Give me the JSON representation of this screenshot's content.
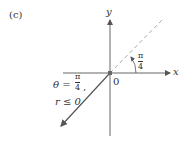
{
  "figure": {
    "panel_label": "(c)",
    "axes": {
      "x_label": "x",
      "y_label": "y",
      "origin_label": "0"
    },
    "angle_label": {
      "numerator": "π",
      "denominator": "4"
    },
    "equation": {
      "theta_prefix": "θ =",
      "theta_numerator": "π",
      "theta_denominator": "4",
      "theta_suffix": ",",
      "r_condition": "r ≤ 0"
    },
    "colors": {
      "axis": "#555555",
      "dashed_line": "#aaaaaa",
      "ray": "#555555",
      "text": "#333333"
    }
  }
}
